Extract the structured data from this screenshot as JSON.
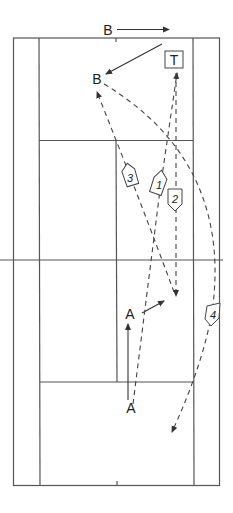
{
  "diagram": {
    "players": {
      "top_b": {
        "label": "B",
        "x": 108,
        "y": 34
      },
      "b": {
        "label": "B",
        "x": 97,
        "y": 83
      },
      "t": {
        "label": "T",
        "x": 174,
        "y": 64
      },
      "a_mid": {
        "label": "A",
        "x": 130,
        "y": 318
      },
      "a_bottom": {
        "label": "A",
        "x": 130,
        "y": 412
      }
    },
    "shot_tags": [
      {
        "label": "1",
        "x": 160,
        "y": 184
      },
      {
        "label": "2",
        "x": 175,
        "y": 198
      },
      {
        "label": "3",
        "x": 130,
        "y": 176
      },
      {
        "label": "4",
        "x": 213,
        "y": 314
      }
    ],
    "colors": {
      "line": "#555555",
      "background": "#ffffff"
    }
  }
}
